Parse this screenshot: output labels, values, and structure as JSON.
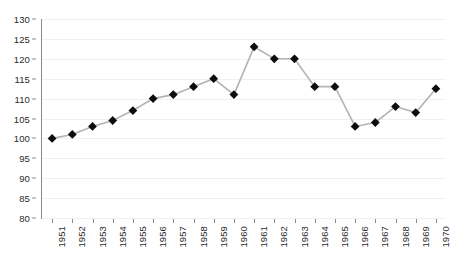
{
  "chart_data": {
    "type": "line",
    "title": "",
    "xlabel": "",
    "ylabel": "",
    "categories": [
      "1951",
      "1952",
      "1953",
      "1954",
      "1955",
      "1956",
      "1957",
      "1958",
      "1959",
      "1960",
      "1961",
      "1962",
      "1963",
      "1964",
      "1965",
      "1966",
      "1967",
      "1968",
      "1969",
      "1970"
    ],
    "values": [
      100,
      101,
      103,
      104.5,
      107,
      110,
      111,
      113,
      115,
      111,
      123,
      120,
      120,
      113,
      113,
      103,
      104,
      108,
      106.5,
      112.5
    ],
    "ylim": [
      80,
      130
    ],
    "yticks": [
      80,
      85,
      90,
      95,
      100,
      105,
      110,
      115,
      120,
      125,
      130
    ],
    "ytick_labels": [
      "80",
      "85",
      "90",
      "95",
      "100",
      "105",
      "110",
      "115",
      "120",
      "125",
      "130"
    ],
    "grid": true,
    "legend": "none",
    "marker": "diamond",
    "marker_color": "#0d0d0d",
    "line_color": "#b3b3b3",
    "gridline_color": "#f0f0f0",
    "axis_color": "#8a8a8a",
    "background": "#ffffff"
  }
}
